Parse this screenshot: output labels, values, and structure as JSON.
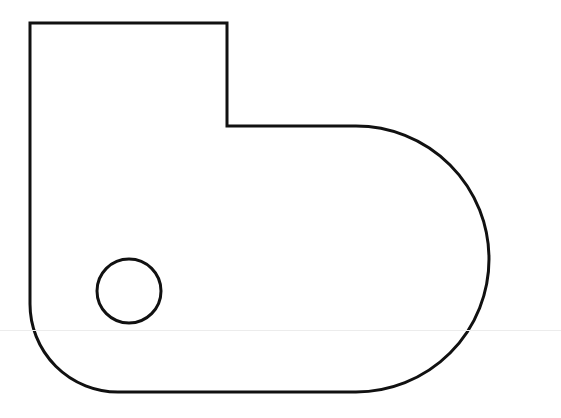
{
  "diagram": {
    "title": "",
    "stroke_color": "#111111",
    "background": "#ffffff",
    "stroke_width": 3,
    "outline": {
      "label": "",
      "top_left": [
        30,
        23
      ],
      "notch_x": 227,
      "notch_step_y": 126,
      "arc_center": [
        356,
        258
      ],
      "arc_radius": 133,
      "bottom_y": 392,
      "bottom_left_radius": 88
    },
    "hole": {
      "label": "",
      "center": [
        129,
        291
      ],
      "radius": 32
    },
    "scan_artifact_y": 330
  }
}
